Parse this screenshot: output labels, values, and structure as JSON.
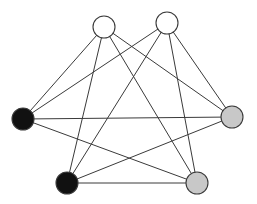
{
  "diagram": {
    "type": "graph",
    "colors": {
      "white": "#ffffff",
      "black": "#111111",
      "gray": "#c8c8c8",
      "stroke": "#3a3a3a"
    },
    "nodes": [
      {
        "id": "A",
        "x": 104,
        "y": 27,
        "r": 11,
        "color": "white"
      },
      {
        "id": "B",
        "x": 167,
        "y": 23,
        "r": 11,
        "color": "white"
      },
      {
        "id": "C",
        "x": 23,
        "y": 119,
        "r": 11,
        "color": "black"
      },
      {
        "id": "D",
        "x": 232,
        "y": 117,
        "r": 11,
        "color": "gray"
      },
      {
        "id": "E",
        "x": 67,
        "y": 183,
        "r": 11,
        "color": "black"
      },
      {
        "id": "F",
        "x": 197,
        "y": 183,
        "r": 11,
        "color": "gray"
      }
    ],
    "edges": [
      [
        "A",
        "C"
      ],
      [
        "A",
        "E"
      ],
      [
        "A",
        "F"
      ],
      [
        "A",
        "D"
      ],
      [
        "B",
        "C"
      ],
      [
        "B",
        "E"
      ],
      [
        "B",
        "F"
      ],
      [
        "B",
        "D"
      ],
      [
        "C",
        "D"
      ],
      [
        "C",
        "F"
      ],
      [
        "E",
        "D"
      ],
      [
        "E",
        "F"
      ]
    ]
  }
}
